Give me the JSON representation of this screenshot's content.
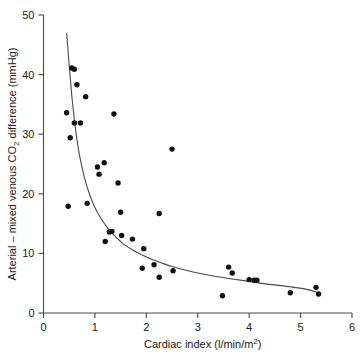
{
  "chart_data": {
    "type": "scatter",
    "title": "",
    "xlabel": "Cardiac index (l/min/m²)",
    "ylabel": "Arterial – mixed venous CO₂ difference (mmHg)",
    "xlim": [
      0,
      6
    ],
    "ylim": [
      0,
      50
    ],
    "xticks": [
      0,
      1,
      2,
      3,
      4,
      5,
      6
    ],
    "xtick_labels": [
      "0",
      "1",
      "2",
      "3",
      "4",
      "5",
      "6"
    ],
    "yticks": [
      0,
      10,
      20,
      30,
      40,
      50
    ],
    "ytick_labels": [
      "0",
      "10",
      "20",
      "30",
      "40",
      "50"
    ],
    "grid": false,
    "legend": null,
    "marker": "filled-circle",
    "marker_color": "#111111",
    "curve_color": "#4a4a4a",
    "points": [
      [
        0.45,
        33.6
      ],
      [
        0.48,
        17.9
      ],
      [
        0.52,
        29.4
      ],
      [
        0.55,
        41.1
      ],
      [
        0.6,
        40.9
      ],
      [
        0.6,
        31.9
      ],
      [
        0.72,
        31.9
      ],
      [
        0.65,
        38.3
      ],
      [
        0.82,
        36.3
      ],
      [
        0.85,
        18.4
      ],
      [
        1.05,
        24.5
      ],
      [
        1.08,
        23.3
      ],
      [
        1.18,
        25.2
      ],
      [
        1.2,
        12.0
      ],
      [
        1.28,
        13.6
      ],
      [
        1.33,
        13.7
      ],
      [
        1.37,
        33.4
      ],
      [
        1.45,
        21.8
      ],
      [
        1.5,
        16.9
      ],
      [
        1.52,
        13.0
      ],
      [
        1.73,
        12.4
      ],
      [
        1.92,
        7.5
      ],
      [
        1.95,
        10.8
      ],
      [
        2.15,
        8.1
      ],
      [
        2.25,
        16.7
      ],
      [
        2.25,
        6.0
      ],
      [
        2.5,
        27.5
      ],
      [
        2.52,
        7.1
      ],
      [
        3.48,
        2.9
      ],
      [
        3.6,
        7.7
      ],
      [
        3.67,
        6.7
      ],
      [
        4.0,
        5.6
      ],
      [
        4.1,
        5.5
      ],
      [
        4.15,
        5.5
      ],
      [
        4.8,
        3.4
      ],
      [
        5.3,
        4.3
      ],
      [
        5.35,
        3.2
      ]
    ],
    "curve": {
      "description": "hyperbolic best-fit curve",
      "points": [
        [
          0.45,
          47.0
        ],
        [
          0.5,
          41.5
        ],
        [
          0.55,
          36.5
        ],
        [
          0.6,
          32.5
        ],
        [
          0.65,
          29.2
        ],
        [
          0.7,
          26.5
        ],
        [
          0.8,
          22.6
        ],
        [
          0.9,
          19.8
        ],
        [
          1.0,
          17.7
        ],
        [
          1.1,
          16.1
        ],
        [
          1.2,
          14.8
        ],
        [
          1.3,
          13.7
        ],
        [
          1.4,
          12.8
        ],
        [
          1.5,
          12.0
        ],
        [
          1.6,
          11.3
        ],
        [
          1.75,
          10.5
        ],
        [
          1.9,
          9.8
        ],
        [
          2.1,
          9.0
        ],
        [
          2.3,
          8.4
        ],
        [
          2.5,
          7.8
        ],
        [
          2.75,
          7.2
        ],
        [
          3.0,
          6.7
        ],
        [
          3.3,
          6.2
        ],
        [
          3.6,
          5.8
        ],
        [
          4.0,
          5.3
        ],
        [
          4.4,
          4.8
        ],
        [
          4.8,
          4.4
        ],
        [
          5.1,
          4.0
        ],
        [
          5.35,
          3.4
        ]
      ]
    }
  }
}
